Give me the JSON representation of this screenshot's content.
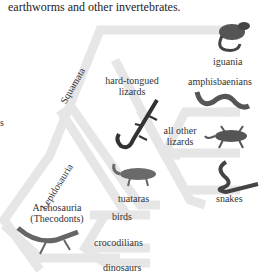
{
  "caption": "earthworms and other invertebrates.",
  "left_fragment": "s",
  "colors": {
    "band": "#e6e6e6",
    "text": "#333333",
    "background": "#ffffff"
  },
  "clades": {
    "lepidosauria": "Lepidosauria",
    "squamata": "Squamata",
    "archosauria": "Archosauria",
    "thecodonts": "(Thecodonts)"
  },
  "taxa": {
    "iguania": "iguania",
    "hard_tongued_1": "hard-tongued",
    "hard_tongued_2": "lizards",
    "amphisbaenians": "amphisbaenians",
    "all_other_1": "all other",
    "all_other_2": "lizards",
    "tuataras": "tuataras",
    "snakes": "snakes",
    "birds": "birds",
    "crocodilians": "crocodilians",
    "dinosaurs": "dinosaurs"
  },
  "icons": [
    "iguana-icon",
    "hard-tongued-lizard-icon",
    "amphisbaenian-icon",
    "gecko-lizard-icon",
    "tuatara-icon",
    "snake-icon",
    "thecodont-icon"
  ]
}
